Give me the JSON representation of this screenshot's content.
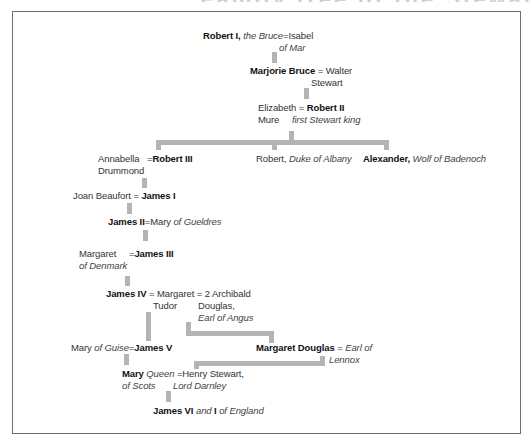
{
  "title": "Family tree of the Stewart kings of Scotland",
  "colors": {
    "connector": "#b4b4b4",
    "frame": "#6e6e6e",
    "text": "#333333"
  },
  "nodes": {
    "robert1": {
      "name": "Robert I,",
      "epithet": "the Bruce",
      "eq": "=",
      "spouse": "Isabel",
      "spouse_line2": "of Mar"
    },
    "marjorie": {
      "name": "Marjorie Bruce",
      "eq": "=",
      "spouse": "Walter",
      "spouse_line2": "Stewart"
    },
    "robert2": {
      "spouse": "Elizabeth",
      "spouse_line2": "Mure",
      "eq": "=",
      "name": "Robert II",
      "epithet": "first Stewart king"
    },
    "robert3": {
      "spouse": "Annabella",
      "spouse_line2": "Drummond",
      "eq": "=",
      "name": "Robert III"
    },
    "albany": {
      "name": "Robert,",
      "epithet": "Duke of Albany"
    },
    "alexander": {
      "name": "Alexander,",
      "epithet": "Wolf of Badenoch"
    },
    "james1": {
      "spouse": "Joan Beaufort",
      "eq": "=",
      "name": "James I"
    },
    "james2": {
      "name": "James II",
      "eq": "=",
      "spouse": "Mary",
      "spouse_epithet": "of Gueldres"
    },
    "james3": {
      "spouse": "Margaret",
      "spouse_line2": "of Denmark",
      "eq": "=",
      "name": "James III"
    },
    "james4": {
      "name": "James IV",
      "eq": "=",
      "spouse": "Margaret",
      "spouse_line2": "Tudor",
      "eq2": "= 2",
      "spouse2": "Archibald",
      "spouse2_line2": "Douglas,",
      "spouse2_line3": "Earl of Angus"
    },
    "james5": {
      "spouse": "Mary",
      "spouse_epithet": "of Guise",
      "eq": "=",
      "name": "James V"
    },
    "margaret_douglas": {
      "name": "Margaret Douglas",
      "eq": "=",
      "spouse": "Earl of",
      "spouse_line2": "Lennox"
    },
    "mary": {
      "name": "Mary",
      "epithet": "Queen",
      "epithet_line2": "of Scots",
      "eq": "=",
      "spouse": "Henry Stewart,",
      "spouse_line2": "Lord Darnley"
    },
    "james6": {
      "name": "James VI",
      "and": "and",
      "name2": "I",
      "epithet": "of England"
    }
  }
}
